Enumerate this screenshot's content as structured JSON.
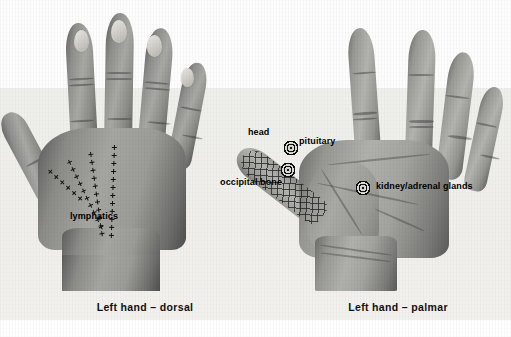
{
  "figure": {
    "type": "reflexology-hand-chart",
    "background_color": "#f1f0ed",
    "label_color": "#000000"
  },
  "panels": [
    {
      "id": "dorsal",
      "caption": "Left hand – dorsal",
      "caption_x": 145,
      "caption_y": 307,
      "view": "dorsal",
      "annotations": [
        {
          "name": "lymphatics",
          "label": "lymphatics",
          "x": 70,
          "y": 217,
          "align": "left",
          "marker": "dotted-cross-line"
        }
      ]
    },
    {
      "id": "palmar",
      "caption": "Left hand – palmar",
      "caption_x": 398,
      "caption_y": 307,
      "view": "palmar",
      "annotations": [
        {
          "name": "head",
          "label": "head",
          "x": 248,
          "y": 134,
          "align": "left",
          "marker": "none"
        },
        {
          "name": "pituitary",
          "label": "pituitary",
          "x": 299,
          "y": 142,
          "align": "left",
          "marker": "bullseye",
          "marker_x": 291,
          "marker_y": 148
        },
        {
          "name": "occipital-bone",
          "label": "occipital bone",
          "x": 282,
          "y": 183,
          "align": "right",
          "marker": "bullseye",
          "marker_x": 288,
          "marker_y": 170
        },
        {
          "name": "kidney-adrenal-glands",
          "label": "kidney/adrenal glands",
          "x": 376,
          "y": 187,
          "align": "left",
          "marker": "bullseye",
          "marker_x": 363,
          "marker_y": 188
        }
      ],
      "zones": [
        {
          "name": "head-zone-hatching",
          "region": "thumb",
          "pattern": "cross-hatch"
        }
      ]
    }
  ]
}
